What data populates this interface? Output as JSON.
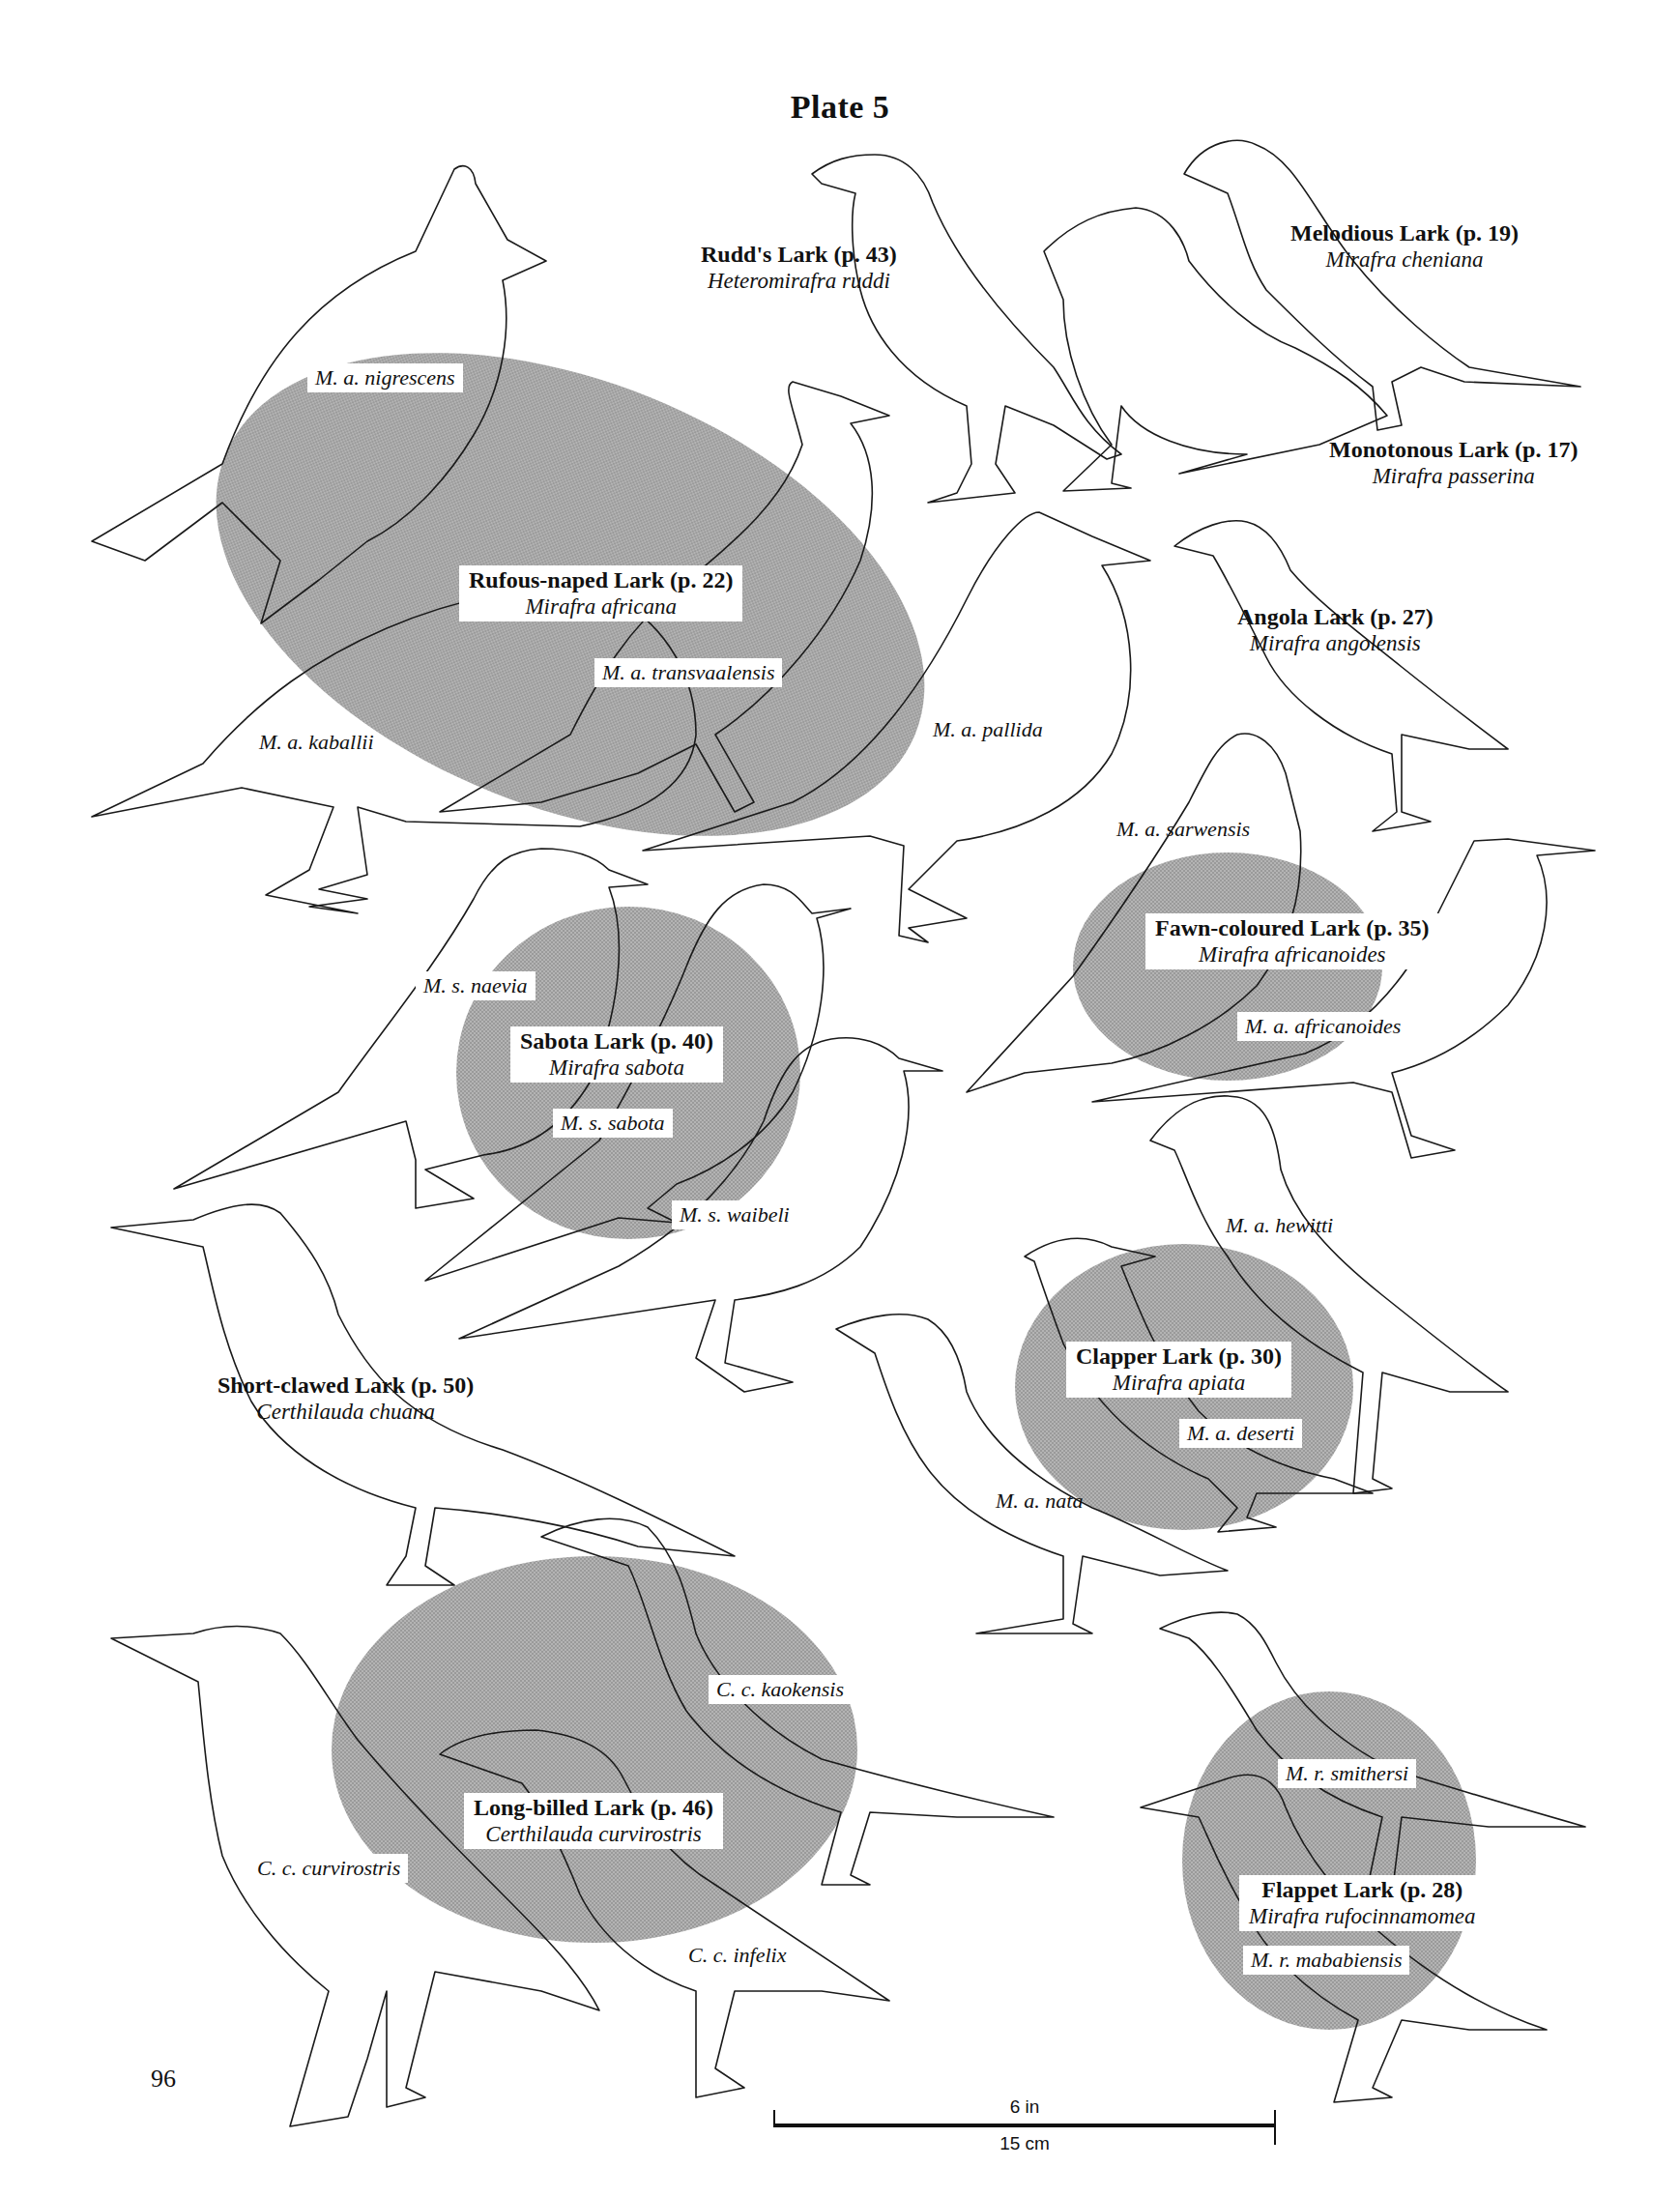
{
  "plate": {
    "title": "Plate 5",
    "page_number": "96",
    "shade_color": "#a8a8a8",
    "line_color": "#1a1a1a"
  },
  "species": [
    {
      "id": "rudds",
      "common": "Rudd's Lark (p. 43)",
      "scientific": "Heteromirafra ruddi"
    },
    {
      "id": "melodious",
      "common": "Melodious Lark (p. 19)",
      "scientific": "Mirafra cheniana"
    },
    {
      "id": "monotonous",
      "common": "Monotonous Lark (p. 17)",
      "scientific": "Mirafra passerina"
    },
    {
      "id": "rufous-naped",
      "common": "Rufous-naped Lark (p. 22)",
      "scientific": "Mirafra africana"
    },
    {
      "id": "angola",
      "common": "Angola Lark (p. 27)",
      "scientific": "Mirafra angolensis"
    },
    {
      "id": "fawn-coloured",
      "common": "Fawn-coloured Lark (p. 35)",
      "scientific": "Mirafra africanoides"
    },
    {
      "id": "sabota",
      "common": "Sabota Lark (p. 40)",
      "scientific": "Mirafra sabota"
    },
    {
      "id": "short-clawed",
      "common": "Short-clawed Lark (p. 50)",
      "scientific": "Certhilauda chuana"
    },
    {
      "id": "clapper",
      "common": "Clapper Lark (p. 30)",
      "scientific": "Mirafra apiata"
    },
    {
      "id": "long-billed",
      "common": "Long-billed Lark (p. 46)",
      "scientific": "Certhilauda curvirostris"
    },
    {
      "id": "flappet",
      "common": "Flappet Lark (p. 28)",
      "scientific": "Mirafra rufocinnamomea"
    }
  ],
  "subspecies": [
    "M. a. nigrescens",
    "M. a. transvaalensis",
    "M. a. kaballii",
    "M. a. pallida",
    "M. a. sarwensis",
    "M. a. africanoides",
    "M. s. naevia",
    "M. s. sabota",
    "M. s. waibeli",
    "M. a. hewitti",
    "M. a. deserti",
    "M. a. nata",
    "C. c. kaokensis",
    "C. c. curvirostris",
    "C. c. infelix",
    "M. r. smithersi",
    "M. r. mababiensis"
  ],
  "scale_bar": {
    "imperial": "6 in",
    "metric": "15 cm"
  }
}
